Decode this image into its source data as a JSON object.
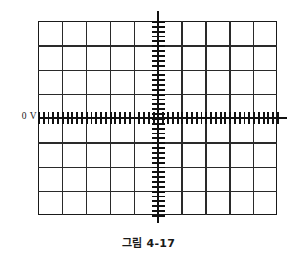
{
  "figure": {
    "caption": "그림 4-17",
    "kind": "oscilloscope-graticule"
  },
  "labels": {
    "zero_volt": "0 V"
  },
  "chart_data": {
    "type": "grid",
    "title": "",
    "subtitle": "",
    "xlabel": "",
    "ylabel": "",
    "annotations": [
      {
        "text": "0 V",
        "position": "left-of-horizontal-center-axis",
        "x_div": -5,
        "y_div": 0
      },
      {
        "text": "그림 4-17",
        "position": "below-figure",
        "role": "caption"
      }
    ],
    "graticule": {
      "horizontal_divisions": 10,
      "vertical_divisions": 8,
      "division_px": 23.9,
      "minor_ticks_per_division": 5,
      "grid": true,
      "border": true,
      "center_axes": [
        "horizontal",
        "vertical"
      ],
      "axis_overshoot_px": 10
    },
    "xlim": [
      -5,
      5
    ],
    "ylim": [
      -4,
      4
    ],
    "series": [],
    "values": [],
    "categories": []
  },
  "colors": {
    "grid_line": "#2a2a2a",
    "border": "#1a1a1a",
    "axis": "#111111",
    "tick": "#111111",
    "text": "#1a1a1a",
    "background": "#ffffff"
  }
}
